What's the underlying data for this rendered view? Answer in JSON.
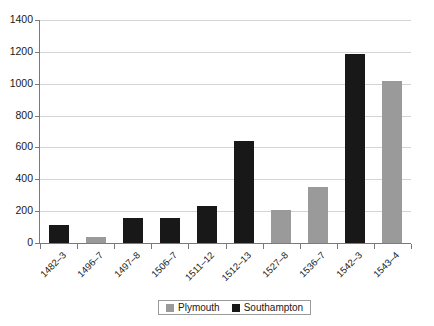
{
  "chart_data": {
    "type": "bar",
    "title": "",
    "subtitle": "",
    "xlabel": "",
    "ylabel": "",
    "ylim": [
      0,
      1400
    ],
    "ytick_step": 200,
    "yticks": [
      0,
      200,
      400,
      600,
      800,
      1000,
      1200,
      1400
    ],
    "ytick_labels": [
      "0",
      "200",
      "400",
      "600",
      "800",
      "1000",
      "1200",
      "1400"
    ],
    "grid": true,
    "legend_position": "bottom",
    "categories": [
      "1482–3",
      "1496–7",
      "1497–8",
      "1506–7",
      "1511–12",
      "1512–13",
      "1527–8",
      "1536–7",
      "1542–3",
      "1543–4"
    ],
    "series": [
      {
        "name": "Plymouth",
        "color": "#9a9a9a",
        "values": [
          null,
          40,
          null,
          null,
          null,
          null,
          210,
          350,
          null,
          1020
        ]
      },
      {
        "name": "Southampton",
        "color": "#181818",
        "values": [
          110,
          null,
          155,
          160,
          235,
          640,
          null,
          null,
          1185,
          null
        ]
      }
    ],
    "bars": [
      {
        "category": "1482–3",
        "series": "Southampton",
        "value": 110,
        "color": "#181818"
      },
      {
        "category": "1496–7",
        "series": "Plymouth",
        "value": 40,
        "color": "#9a9a9a"
      },
      {
        "category": "1497–8",
        "series": "Southampton",
        "value": 155,
        "color": "#181818"
      },
      {
        "category": "1506–7",
        "series": "Southampton",
        "value": 160,
        "color": "#181818"
      },
      {
        "category": "1511–12",
        "series": "Southampton",
        "value": 235,
        "color": "#181818"
      },
      {
        "category": "1512–13",
        "series": "Southampton",
        "value": 640,
        "color": "#181818"
      },
      {
        "category": "1527–8",
        "series": "Plymouth",
        "value": 210,
        "color": "#9a9a9a"
      },
      {
        "category": "1536–7",
        "series": "Plymouth",
        "value": 350,
        "color": "#9a9a9a"
      },
      {
        "category": "1542–3",
        "series": "Southampton",
        "value": 1185,
        "color": "#181818"
      },
      {
        "category": "1543–4",
        "series": "Plymouth",
        "value": 1020,
        "color": "#9a9a9a"
      }
    ]
  },
  "legend": {
    "entries": [
      {
        "label": "Plymouth",
        "color": "#9a9a9a"
      },
      {
        "label": "Southampton",
        "color": "#181818"
      }
    ]
  },
  "style": {
    "gridline_color": "#d4d4d4",
    "axis_color": "#7a7a7a",
    "background": "#ffffff",
    "text_color": "#1a1a1a"
  }
}
